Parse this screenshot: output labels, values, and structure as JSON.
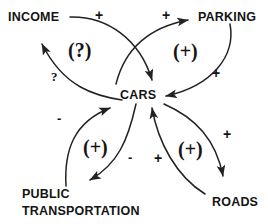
{
  "diagram": {
    "stroke_color": "#222222",
    "text_color": "#141414",
    "background_color": "#ffffff",
    "nodes": [
      {
        "id": "income",
        "label": "INCOME",
        "x": 8,
        "y": 10
      },
      {
        "id": "parking",
        "label": "PARKING",
        "x": 198,
        "y": 10
      },
      {
        "id": "cars",
        "label": "CARS",
        "x": 120,
        "y": 88
      },
      {
        "id": "public1",
        "label": "PUBLIC",
        "x": 22,
        "y": 187
      },
      {
        "id": "public2",
        "label": "TRANSPORTATION",
        "x": 22,
        "y": 204
      },
      {
        "id": "roads",
        "label": "ROADS",
        "x": 212,
        "y": 195
      }
    ],
    "loop_markers": [
      {
        "id": "loop-income",
        "label": "(?)",
        "x": 68,
        "y": 40
      },
      {
        "id": "loop-parking",
        "label": "(+)",
        "x": 173,
        "y": 41
      },
      {
        "id": "loop-public",
        "label": "(+)",
        "x": 83,
        "y": 137
      },
      {
        "id": "loop-roads",
        "label": "(+)",
        "x": 178,
        "y": 139
      }
    ],
    "polarities": [
      {
        "id": "income-to-cars",
        "label": "+",
        "x": 95,
        "y": 8
      },
      {
        "id": "cars-to-income",
        "label": "?",
        "x": 51,
        "y": 70
      },
      {
        "id": "cars-to-parking",
        "label": "+",
        "x": 162,
        "y": 8
      },
      {
        "id": "parking-to-cars",
        "label": "+",
        "x": 212,
        "y": 66
      },
      {
        "id": "cars-to-public",
        "label": "-",
        "x": 57,
        "y": 112
      },
      {
        "id": "public-to-cars",
        "label": "-",
        "x": 128,
        "y": 151
      },
      {
        "id": "cars-to-roads",
        "label": "+",
        "x": 223,
        "y": 127
      },
      {
        "id": "roads-to-cars",
        "label": "+",
        "x": 154,
        "y": 151
      }
    ]
  }
}
